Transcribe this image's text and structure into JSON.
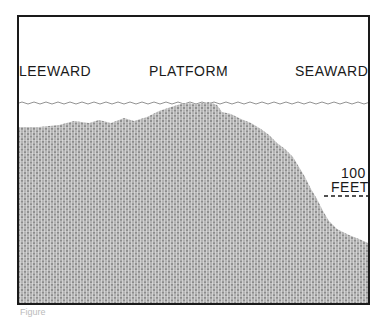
{
  "diagram": {
    "labels": {
      "leeward": "LEEWARD",
      "platform": "PLATFORM",
      "seaward": "SEAWARD",
      "depth_value": "100",
      "depth_unit": "FEET"
    },
    "colors": {
      "ink": "#1a1a1a",
      "fill": "#9a9a9a",
      "background": "#ffffff"
    },
    "caption": "Figure"
  }
}
